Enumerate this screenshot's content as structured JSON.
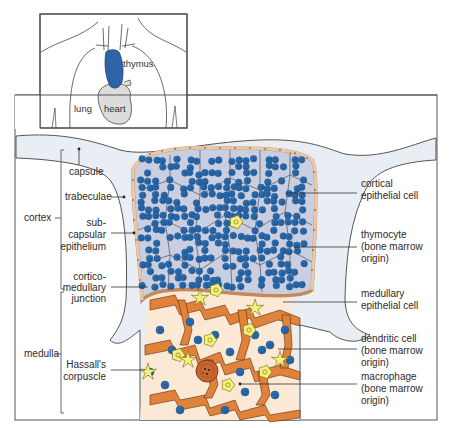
{
  "inset": {
    "labels": {
      "thymus": "thymus",
      "lung": "lung",
      "heart": "heart"
    }
  },
  "regions": {
    "cortex": "cortex",
    "medulla": "medulla"
  },
  "left_labels": {
    "capsule": "capsule",
    "trabeculae": "trabeculae",
    "subcapsular": [
      "sub-",
      "capsular",
      "epithelium"
    ],
    "corticomedullary": [
      "cortico-",
      "medullary",
      "junction"
    ],
    "hassalls": [
      "Hassall's",
      "corpuscle"
    ]
  },
  "right_labels": {
    "cortical_epithelial": [
      "cortical",
      "epithelial  cell"
    ],
    "thymocyte": [
      "thymocyte",
      "(bone  marrow",
      "origin)"
    ],
    "medullary_epithelial": [
      "medullary",
      "epithelial  cell"
    ],
    "dendritic": [
      "dendritic  cell",
      "(bone  marrow",
      "origin)"
    ],
    "macrophage": [
      "macrophage",
      "(bone  marrow",
      "origin)"
    ]
  },
  "colors": {
    "thymus_blue": "#2f63a8",
    "thymocyte_blue": "#2a6db2",
    "capsule_fill": "#e8eef3",
    "cortex_bg": "#c9cfe0",
    "medulla_bg": "#fbe9d6",
    "epithelial_orange": "#e0823a",
    "dendritic_yellow": "#f5f07a",
    "subcapsular_tan": "#e7c9ad",
    "heart_gray": "#dcdcdc"
  }
}
